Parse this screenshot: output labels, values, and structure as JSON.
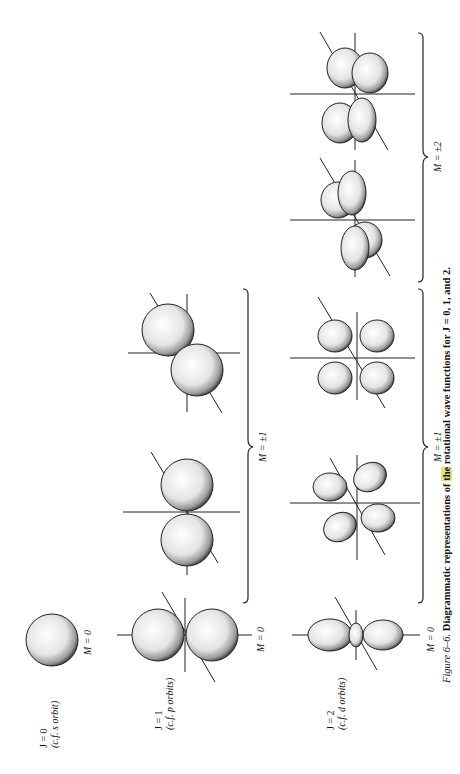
{
  "figure": {
    "caption_prefix": "Figure 6–6.",
    "caption_text_a": "Diagrammatic representations of ",
    "caption_highlight": "the",
    "caption_text_b": " rotational wave functions for J = 0, 1, and 2.",
    "rows": [
      {
        "j_label": "J = 0",
        "sub_label": "(c.f. s orbit)",
        "m0_label": "M = 0"
      },
      {
        "j_label": "J = 1",
        "sub_label": "(c.f. p orbits)",
        "m0_label": "M = 0",
        "m1_label": "M = ±1"
      },
      {
        "j_label": "J = 2",
        "sub_label": "(c.f. d orbits)",
        "m0_label": "M = 0",
        "m1_label": "M = ±1",
        "m2_label": "M = ±2"
      }
    ],
    "signs": {
      "plus": "+",
      "minus": "−"
    },
    "highlight_color": "#e9e27a"
  }
}
